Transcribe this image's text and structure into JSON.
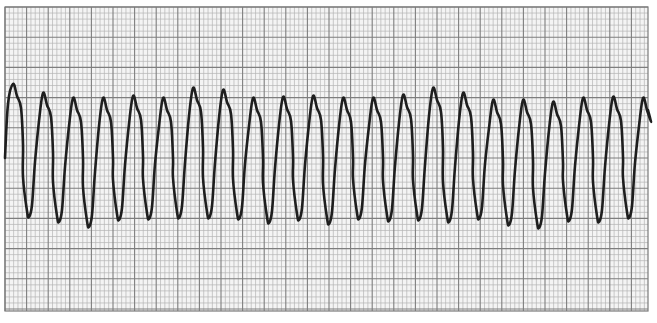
{
  "chart_data": {
    "type": "line",
    "title": "",
    "subtitle": "",
    "xlabel": "",
    "ylabel": "",
    "grid": true,
    "legend": [],
    "paper": {
      "left": 5,
      "top": 7,
      "right": 648,
      "bottom": 311,
      "major_x_spacing_px": 21.6,
      "major_y_spacing_px": 30.2,
      "minor_per_major": 5,
      "minor_color": "#b4b4b4",
      "major_color": "#7e7e7e",
      "background": "#f4f4f4"
    },
    "trace_color": "#1e1e1e",
    "series": [
      {
        "name": "ECG lead",
        "peaks_px": [
          [
            13,
            84
          ],
          [
            43,
            93
          ],
          [
            73,
            98
          ],
          [
            103,
            98
          ],
          [
            133,
            96
          ],
          [
            163,
            98
          ],
          [
            193,
            88
          ],
          [
            223,
            90
          ],
          [
            253,
            98
          ],
          [
            283,
            97
          ],
          [
            313,
            96
          ],
          [
            343,
            98
          ],
          [
            373,
            98
          ],
          [
            403,
            95
          ],
          [
            433,
            88
          ],
          [
            463,
            93
          ],
          [
            493,
            100
          ],
          [
            523,
            100
          ],
          [
            553,
            102
          ],
          [
            583,
            98
          ],
          [
            613,
            97
          ],
          [
            643,
            98
          ]
        ],
        "troughs_px": [
          [
            29,
            217
          ],
          [
            59,
            222
          ],
          [
            89,
            227
          ],
          [
            119,
            220
          ],
          [
            149,
            219
          ],
          [
            179,
            218
          ],
          [
            209,
            218
          ],
          [
            239,
            219
          ],
          [
            269,
            223
          ],
          [
            299,
            220
          ],
          [
            329,
            224
          ],
          [
            359,
            219
          ],
          [
            389,
            221
          ],
          [
            419,
            220
          ],
          [
            449,
            222
          ],
          [
            479,
            219
          ],
          [
            509,
            225
          ],
          [
            539,
            228
          ],
          [
            569,
            221
          ],
          [
            599,
            222
          ],
          [
            629,
            218
          ]
        ],
        "start_px": [
          5,
          158
        ],
        "end_px": [
          648,
          110
        ]
      }
    ],
    "complex_count": 22,
    "approx_cycle_px": 30
  }
}
